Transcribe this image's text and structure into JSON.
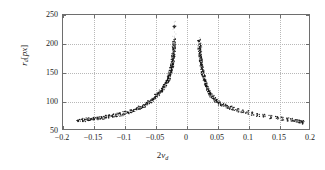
{
  "chart_data": {
    "type": "scatter",
    "title": "",
    "xlabel": "2v_d",
    "ylabel": "r_d[px]",
    "xlim": [
      -0.2,
      0.2
    ],
    "ylim": [
      50,
      250
    ],
    "grid": true,
    "legend": null,
    "xticks": [
      "-0.2",
      "-0.15",
      "-0.1",
      "-0.05",
      "0",
      "0.05",
      "0.1",
      "0.15",
      "0.2"
    ],
    "xtick_values": [
      -0.2,
      -0.15,
      -0.1,
      -0.05,
      0,
      0.05,
      0.1,
      0.15,
      0.2
    ],
    "yticks": [
      "50",
      "100",
      "150",
      "200",
      "250"
    ],
    "ytick_values": [
      50,
      100,
      150,
      200,
      250
    ],
    "marker_color": "#101010",
    "grid_color": "#b8b8b8",
    "axis_color": "#6e6e6e",
    "series": [
      {
        "name": "left-branch",
        "x": [
          -0.175,
          -0.17,
          -0.165,
          -0.16,
          -0.155,
          -0.15,
          -0.145,
          -0.14,
          -0.135,
          -0.13,
          -0.125,
          -0.12,
          -0.115,
          -0.11,
          -0.105,
          -0.1,
          -0.095,
          -0.09,
          -0.085,
          -0.08,
          -0.076,
          -0.072,
          -0.068,
          -0.064,
          -0.06,
          -0.057,
          -0.054,
          -0.051,
          -0.048,
          -0.045,
          -0.043,
          -0.041,
          -0.039,
          -0.037,
          -0.035,
          -0.033,
          -0.031,
          -0.03,
          -0.029,
          -0.028,
          -0.027,
          -0.026,
          -0.025,
          -0.024,
          -0.0235,
          -0.023,
          -0.0225,
          -0.022,
          -0.0215,
          -0.021,
          -0.0207,
          -0.0204,
          -0.0201,
          -0.0198,
          -0.0196,
          -0.0194,
          -0.0192,
          -0.019
        ],
        "y": [
          65,
          66,
          66,
          67,
          67,
          68,
          69,
          69,
          70,
          71,
          72,
          73,
          74,
          75,
          76,
          78,
          79,
          81,
          83,
          85,
          87,
          89,
          91,
          94,
          97,
          99,
          102,
          105,
          108,
          111,
          114,
          116,
          119,
          122,
          125,
          129,
          133,
          136,
          138,
          141,
          144,
          147,
          151,
          155,
          157,
          160,
          163,
          166,
          170,
          174,
          177,
          180,
          184,
          189,
          193,
          198,
          205,
          230
        ]
      },
      {
        "name": "right-branch",
        "x": [
          0.0215,
          0.0218,
          0.0221,
          0.0224,
          0.0228,
          0.0232,
          0.0236,
          0.024,
          0.0245,
          0.025,
          0.0256,
          0.0262,
          0.0268,
          0.0275,
          0.0283,
          0.0291,
          0.03,
          0.031,
          0.032,
          0.0332,
          0.0345,
          0.036,
          0.0376,
          0.0394,
          0.0414,
          0.0436,
          0.046,
          0.0487,
          0.0517,
          0.055,
          0.0587,
          0.0628,
          0.0674,
          0.0725,
          0.0782,
          0.0845,
          0.0915,
          0.0992,
          0.1077,
          0.117,
          0.127,
          0.1375,
          0.148,
          0.157,
          0.165,
          0.172,
          0.178,
          0.183,
          0.1875,
          0.19
        ],
        "y": [
          205,
          198,
          193,
          189,
          184,
          180,
          176,
          172,
          168,
          164,
          160,
          156,
          152,
          148,
          144,
          140,
          136,
          132,
          129,
          125,
          122,
          118,
          115,
          112,
          109,
          106,
          103,
          100,
          98,
          95,
          93,
          91,
          89,
          87,
          85,
          83,
          81,
          79,
          77,
          75,
          73,
          71,
          70,
          68,
          67,
          66,
          65,
          64,
          63,
          62
        ]
      },
      {
        "name": "left-sparse-tail",
        "x": [
          -0.0188,
          -0.0187,
          -0.0186,
          -0.0185,
          -0.0184,
          -0.0189,
          -0.0191,
          -0.0193
        ],
        "y": [
          213,
          219,
          226,
          232,
          238,
          210,
          202,
          196
        ]
      },
      {
        "name": "right-sparse-tail",
        "x": [
          0.0232,
          0.0236,
          0.024,
          0.0244,
          0.0228,
          0.0225
        ],
        "y": [
          200,
          196,
          192,
          188,
          205,
          210
        ]
      }
    ]
  }
}
